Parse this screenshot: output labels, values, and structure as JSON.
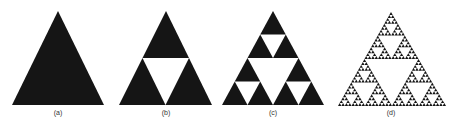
{
  "figure": {
    "background": "#ffffff",
    "fill_color": "#151515",
    "panels": [
      {
        "label": "(a)",
        "depth": 0,
        "apex": [
          58,
          11
        ],
        "base_left": [
          12,
          105
        ],
        "base_right": [
          104,
          105
        ],
        "label_pos": [
          58,
          113
        ]
      },
      {
        "label": "(b)",
        "depth": 1,
        "apex": [
          166,
          11
        ],
        "base_left": [
          119,
          105
        ],
        "base_right": [
          212,
          105
        ],
        "label_pos": [
          166,
          113
        ]
      },
      {
        "label": "(c)",
        "depth": 2,
        "apex": [
          273,
          11
        ],
        "base_left": [
          222,
          105
        ],
        "base_right": [
          324,
          105
        ],
        "label_pos": [
          273,
          113
        ]
      },
      {
        "label": "(d)",
        "depth": 5,
        "apex": [
          391,
          12
        ],
        "base_left": [
          338,
          106
        ],
        "base_right": [
          446,
          106
        ],
        "label_pos": [
          391,
          113
        ]
      }
    ]
  }
}
